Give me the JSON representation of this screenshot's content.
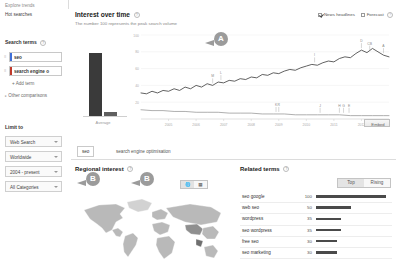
{
  "sidebar": {
    "explore_trends": "Explore trends",
    "hot_searches": "Hot searches",
    "search_terms_head": "Search terms",
    "terms": [
      {
        "text": "seo",
        "color": "#3f6fd8"
      },
      {
        "text": "search engine o",
        "color": "#c0392b"
      }
    ],
    "add_term": "+ Add term",
    "other_comparisons": "Other comparisons",
    "limit_to_head": "Limit to",
    "filters": [
      {
        "label": "Web Search"
      },
      {
        "label": "Worldwide"
      },
      {
        "label": "2004 - present"
      },
      {
        "label": "All Categories"
      }
    ]
  },
  "interest_over_time": {
    "title": "Interest over time",
    "subtitle": "The number 100 represents the peak search volume",
    "options": [
      {
        "label": "News headlines",
        "checked": true
      },
      {
        "label": "Forecast",
        "checked": false
      }
    ],
    "average_label": "Average",
    "embed_label": "Embed"
  },
  "tabs": [
    {
      "label": "seo",
      "selected": true
    },
    {
      "label": "search engine optimisation",
      "selected": false
    }
  ],
  "regional": {
    "title": "Regional interest",
    "view_globe_icon": "globe-icon",
    "view_bars_icon": "bar-chart-icon"
  },
  "related": {
    "title": "Related terms",
    "toggle": [
      {
        "label": "Top",
        "selected": true
      },
      {
        "label": "Rising",
        "selected": false
      }
    ],
    "rows": [
      {
        "term": "seo google",
        "value": 100
      },
      {
        "term": "web seo",
        "value": 50
      },
      {
        "term": "wordpress",
        "value": 35
      },
      {
        "term": "seo wordpress",
        "value": 35
      },
      {
        "term": "free seo",
        "value": 30
      },
      {
        "term": "seo marketing",
        "value": 30
      }
    ]
  },
  "callouts": [
    {
      "label": "A"
    },
    {
      "label": "B"
    },
    {
      "label": "B"
    }
  ],
  "chart_data": {
    "type": "line",
    "title": "Interest over time",
    "xlabel": "",
    "ylabel": "",
    "ylim": [
      0,
      100
    ],
    "yticks": [
      20,
      40,
      60,
      80,
      100
    ],
    "xticks": [
      "2005",
      "2006",
      "2007",
      "2008",
      "2009",
      "2010",
      "2011",
      "2012"
    ],
    "grid": true,
    "legend_position": "none",
    "average_bars": {
      "type": "bar",
      "categories": [
        "seo",
        "search engine optimisation"
      ],
      "values": [
        64,
        5
      ],
      "label": "Average"
    },
    "news_markers": [
      {
        "label": "M",
        "series": "seo",
        "x": 2006.6
      },
      {
        "label": "L",
        "series": "seo",
        "x": 2006.9
      },
      {
        "label": "I",
        "series": "seo",
        "x": 2010.3
      },
      {
        "label": "D",
        "series": "seo",
        "x": 2012.0
      },
      {
        "label": "CB",
        "series": "seo",
        "x": 2012.3
      },
      {
        "label": "A",
        "series": "seo",
        "x": 2012.8
      },
      {
        "label": "K",
        "series": "search engine optimisation",
        "x": 2008.9
      },
      {
        "label": "R",
        "series": "search engine optimisation",
        "x": 2009.0
      },
      {
        "label": "J",
        "series": "search engine optimisation",
        "x": 2010.5
      },
      {
        "label": "H",
        "series": "search engine optimisation",
        "x": 2011.2
      },
      {
        "label": "G",
        "series": "search engine optimisation",
        "x": 2011.35
      },
      {
        "label": "E",
        "series": "search engine optimisation",
        "x": 2011.55
      }
    ],
    "series": [
      {
        "name": "seo",
        "color": "#3a3a3a",
        "x": [
          2004.0,
          2004.2,
          2004.4,
          2004.6,
          2004.8,
          2005.0,
          2005.2,
          2005.4,
          2005.6,
          2005.8,
          2006.0,
          2006.2,
          2006.4,
          2006.6,
          2006.8,
          2007.0,
          2007.2,
          2007.4,
          2007.6,
          2007.8,
          2008.0,
          2008.2,
          2008.4,
          2008.6,
          2008.8,
          2009.0,
          2009.2,
          2009.4,
          2009.6,
          2009.8,
          2010.0,
          2010.2,
          2010.4,
          2010.6,
          2010.8,
          2011.0,
          2011.2,
          2011.4,
          2011.6,
          2011.8,
          2012.0,
          2012.2,
          2012.4,
          2012.6,
          2012.8,
          2013.0
        ],
        "values": [
          31,
          30,
          33,
          31,
          34,
          33,
          36,
          34,
          38,
          36,
          40,
          38,
          42,
          40,
          44,
          43,
          46,
          45,
          48,
          47,
          50,
          49,
          53,
          52,
          55,
          54,
          57,
          59,
          58,
          61,
          63,
          65,
          64,
          67,
          69,
          68,
          72,
          74,
          73,
          78,
          82,
          79,
          84,
          80,
          76,
          74
        ]
      },
      {
        "name": "search engine optimisation",
        "color": "#9a9a9a",
        "x": [
          2004.0,
          2004.4,
          2004.8,
          2005.2,
          2005.6,
          2006.0,
          2006.4,
          2006.8,
          2007.2,
          2007.6,
          2008.0,
          2008.4,
          2008.8,
          2009.2,
          2009.6,
          2010.0,
          2010.4,
          2010.8,
          2011.2,
          2011.6,
          2012.0,
          2012.4,
          2012.8,
          2013.0
        ],
        "values": [
          11,
          10,
          10,
          9,
          9,
          8,
          8,
          8,
          7,
          7,
          7,
          6,
          6,
          6,
          5,
          5,
          5,
          5,
          5,
          4,
          4,
          4,
          4,
          4
        ]
      }
    ]
  }
}
